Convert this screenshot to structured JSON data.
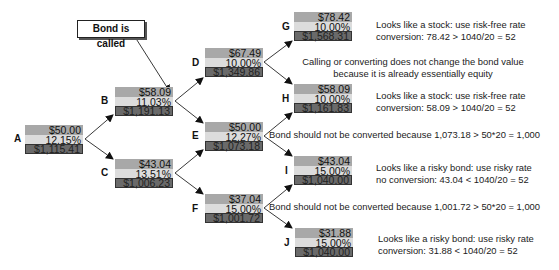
{
  "callout": {
    "label": "Bond is called"
  },
  "nodes": {
    "A": {
      "label": "A",
      "price": "$50.00",
      "rate": "12.15%",
      "value": "$1,115.41"
    },
    "B": {
      "label": "B",
      "price": "$58.09",
      "rate": "11.03%",
      "value": "$1,191.13"
    },
    "C": {
      "label": "C",
      "price": "$43.04",
      "rate": "13.51%",
      "value": "$1,006.23"
    },
    "D": {
      "label": "D",
      "price": "$67.49",
      "rate": "10.00%",
      "value": "$1,349.86"
    },
    "E": {
      "label": "E",
      "price": "$50.00",
      "rate": "12.27%",
      "value": "$1,073.18"
    },
    "F": {
      "label": "F",
      "price": "$37.04",
      "rate": "15.00%",
      "value": "$1,001.72"
    },
    "G": {
      "label": "G",
      "price": "$78.42",
      "rate": "10.00%",
      "value": "$1,568.31"
    },
    "H": {
      "label": "H",
      "price": "$58.09",
      "rate": "10.00%",
      "value": "$1,161.83"
    },
    "I": {
      "label": "I",
      "price": "$43.04",
      "rate": "15.00%",
      "value": "$1,040.00"
    },
    "J": {
      "label": "J",
      "price": "$31.88",
      "rate": "15.00%",
      "value": "$1,040.00"
    }
  },
  "notes": {
    "G": [
      "Looks like a stock: use risk-free rate",
      "conversion: 78.42 > 1040/20 = 52"
    ],
    "D": [
      "Calling or converting does not change the bond value",
      "because it is already essentially equity"
    ],
    "H": [
      "Looks like a stock: use risk-free rate",
      "conversion: 58.09 > 1040/20 = 52"
    ],
    "E": [
      "Bond should not be converted because 1,073.18 > 50*20 = 1,000"
    ],
    "I": [
      "Looks like a risky bond: use risky rate",
      "no conversion: 43.04 < 1040/20 = 52"
    ],
    "F": [
      "Bond should not be converted because 1,001.72 > 50*20 = 1,000"
    ],
    "J": [
      "Looks like a risky bond: use risky rate",
      "conversion: 31.88 < 1040/20 = 52"
    ]
  },
  "colors": {
    "price_row": "#a8a8a8",
    "rate_row": "#dcdcdc",
    "value_row": "#6a6a6a"
  }
}
